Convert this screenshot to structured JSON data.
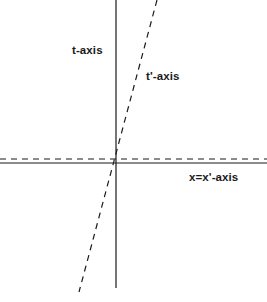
{
  "figure": {
    "kind": "minkowski-spacetime-diagram",
    "background_color": "#ffffff",
    "line_color": "#1a1a1a"
  },
  "labels": {
    "t_axis": "t-axis",
    "t_prime_axis": "t'-axis",
    "x_equals_x_prime_axis": "x=x'-axis"
  },
  "chart_data": {
    "type": "line",
    "title": "",
    "xlabel": "",
    "ylabel": "",
    "grid": false,
    "legend": "none",
    "origin": [
      116,
      161
    ],
    "xlim": [
      0,
      267
    ],
    "ylim": [
      0,
      302
    ],
    "series": [
      {
        "name": "t-axis",
        "style": "solid",
        "color": "#1a1a1a",
        "width": 1.2,
        "points": [
          [
            116,
            0
          ],
          [
            116,
            288
          ]
        ],
        "label": "t-axis",
        "label_position": [
          72,
          50
        ]
      },
      {
        "name": "x=x'-axis",
        "style": "solid",
        "color": "#1a1a1a",
        "width": 1.2,
        "points": [
          [
            0,
            163
          ],
          [
            267,
            163
          ]
        ],
        "label": "x=x'-axis",
        "label_position": [
          189,
          177
        ]
      },
      {
        "name": "x'-axis-dashed",
        "style": "dashed",
        "color": "#1a1a1a",
        "width": 1.2,
        "dash": [
          6,
          5
        ],
        "points": [
          [
            0,
            159
          ],
          [
            267,
            159
          ]
        ]
      },
      {
        "name": "t'-axis",
        "style": "dashed",
        "color": "#1a1a1a",
        "width": 1.2,
        "dash": [
          6,
          5
        ],
        "points": [
          [
            157,
            0
          ],
          [
            79,
            292
          ]
        ],
        "label": "t'-axis",
        "label_position": [
          146,
          76
        ],
        "slope_note": "passes through origin, tilted right of t-axis"
      }
    ]
  }
}
